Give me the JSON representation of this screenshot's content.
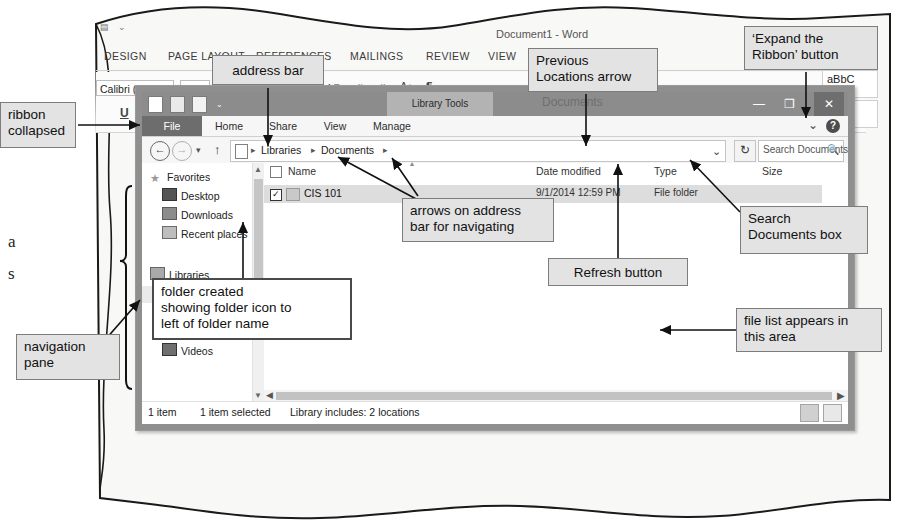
{
  "figure": {
    "kind": "textbook-figure-file-explorer-over-word"
  },
  "book_fragments": [
    {
      "text": "a"
    },
    {
      "text": "s"
    }
  ],
  "word": {
    "title": "Document1 - Word",
    "tabs": [
      "DESIGN",
      "PAGE LAYOUT",
      "REFERENCES",
      "MAILINGS",
      "REVIEW",
      "VIEW"
    ],
    "font_name": "Calibri (Body)",
    "font_size": "11",
    "underline_label": "U",
    "strikethrough_label": "abc",
    "grow_font": "A",
    "shrink_font": "A",
    "pilcrow": "¶",
    "styles": [
      {
        "preview": "aBbC",
        "name": ""
      },
      {
        "preview": "Subti",
        "name": ""
      }
    ]
  },
  "explorer": {
    "contextual_tab_group": "Library Tools",
    "window_title": "Documents",
    "window_controls": {
      "minimize": "—",
      "maximize": "❐",
      "close": "✕"
    },
    "ribbon_tabs": [
      "File",
      "Home",
      "Share",
      "View",
      "Manage"
    ],
    "expand_ribbon_chevron": "⌄",
    "help_label": "?",
    "address": {
      "back": "←",
      "forward": "→",
      "recent_caret": "▾",
      "up": "↑",
      "crumbs": [
        "Libraries",
        "Documents"
      ],
      "separator": "▸",
      "previous_locations": "⌄",
      "refresh": "↻"
    },
    "search": {
      "placeholder": "Search Documents",
      "icon": "search-icon"
    },
    "nav_pane": {
      "groups": [
        {
          "header": {
            "label": "Favorites",
            "icon": "star-icon"
          },
          "items": [
            {
              "label": "Desktop",
              "icon": "desktop-icon"
            },
            {
              "label": "Downloads",
              "icon": "downloads-icon"
            },
            {
              "label": "Recent places",
              "icon": "recent-places-icon"
            }
          ]
        },
        {
          "header": {
            "label": "Libraries",
            "icon": "libraries-icon"
          },
          "items": [
            {
              "label": "Documents",
              "icon": "documents-icon",
              "selected": true
            },
            {
              "label": "Music",
              "icon": "music-icon"
            },
            {
              "label": "Pictures",
              "icon": "pictures-icon"
            },
            {
              "label": "Videos",
              "icon": "videos-icon"
            }
          ]
        }
      ]
    },
    "file_list": {
      "columns": [
        "Name",
        "Date modified",
        "Type",
        "Size"
      ],
      "rows": [
        {
          "checked": "✓",
          "name": "CIS 101",
          "date_modified": "9/1/2014 12:59 PM",
          "type": "File folder",
          "size": ""
        }
      ]
    },
    "status_bar": {
      "item_count": "1 item",
      "selection": "1 item selected",
      "library_info": "Library includes: 2 locations",
      "view_details": "details-view-icon",
      "view_large_icons": "large-icons-view-icon"
    }
  },
  "callouts": {
    "ribbon_collapsed": "ribbon\ncollapsed",
    "address_bar": "address bar",
    "previous_locations": "Previous\nLocations arrow",
    "expand_ribbon": "‘Expand the\nRibbon’ button",
    "arrows_on_address_bar": "arrows on address\nbar for navigating",
    "search_documents_box": "Search\nDocuments box",
    "refresh_button": "Refresh button",
    "folder_created": "folder created\nshowing folder icon to\nleft of folder name",
    "file_list_area": "file list appears in\nthis area",
    "navigation_pane": "navigation\npane"
  },
  "colors": {
    "callout_fill": "#e3e3e3",
    "callout_border": "#7d7d7d",
    "titlebar": "#8c8c8c",
    "file_tab": "#6d6d6d",
    "selected_row": "#dddddd",
    "paper": "#f7f7f5"
  }
}
